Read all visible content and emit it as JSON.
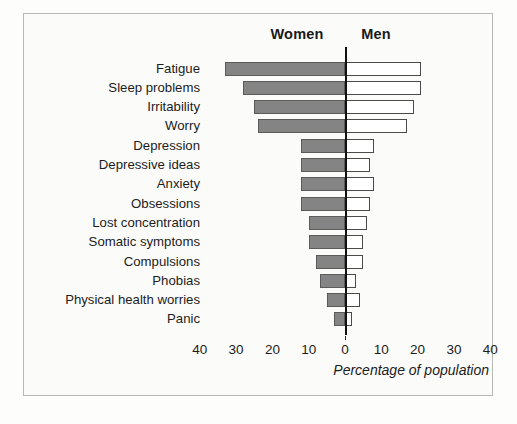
{
  "chart_data": {
    "type": "bar",
    "orientation": "horizontal-diverging",
    "title": "",
    "xlabel": "Percentage of population",
    "ylabel": "",
    "grid": false,
    "legend_position": "top",
    "xlim": [
      -40,
      40
    ],
    "xticks": [
      {
        "value": -40,
        "label": "40"
      },
      {
        "value": -30,
        "label": "30"
      },
      {
        "value": -20,
        "label": "20"
      },
      {
        "value": -10,
        "label": "10"
      },
      {
        "value": 0,
        "label": "0"
      },
      {
        "value": 10,
        "label": "10"
      },
      {
        "value": 20,
        "label": "20"
      },
      {
        "value": 30,
        "label": "30"
      },
      {
        "value": 40,
        "label": "40"
      }
    ],
    "categories": [
      "Fatigue",
      "Sleep problems",
      "Irritability",
      "Worry",
      "Depression",
      "Depressive ideas",
      "Anxiety",
      "Obsessions",
      "Lost concentration",
      "Somatic symptoms",
      "Compulsions",
      "Phobias",
      "Physical health worries",
      "Panic"
    ],
    "series": [
      {
        "name": "Women",
        "color": "#848484",
        "direction": "left",
        "values": [
          33,
          28,
          25,
          24,
          12,
          12,
          12,
          12,
          10,
          10,
          8,
          7,
          5,
          3
        ]
      },
      {
        "name": "Men",
        "color": "#ffffff",
        "direction": "right",
        "values": [
          21,
          21,
          19,
          17,
          8,
          7,
          8,
          7,
          6,
          5,
          5,
          3,
          4,
          2
        ]
      }
    ]
  },
  "legend": {
    "women": "Women",
    "men": "Men"
  },
  "axis": {
    "caption": "Percentage of population"
  },
  "colors": {
    "women_fill": "#848484",
    "women_border": "#5b5b5b",
    "men_fill": "#ffffff",
    "men_border": "#4a4a4a",
    "axis_line": "#111111",
    "frame_border": "#b9b9b4",
    "background": "#fbfbfa"
  }
}
